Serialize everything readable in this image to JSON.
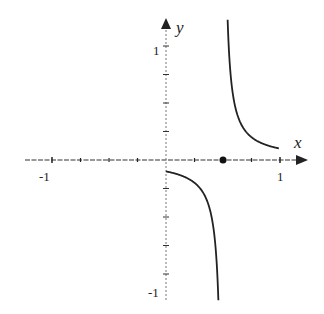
{
  "chart_data": {
    "type": "line",
    "title": "",
    "xlabel": "x",
    "ylabel": "y",
    "xlim": [
      -1.1,
      1.2
    ],
    "ylim": [
      -1.25,
      1.25
    ],
    "grid": false,
    "x_ticks": [
      -1,
      -0.75,
      -0.5,
      -0.25,
      0,
      0.25,
      0.5,
      0.75,
      1
    ],
    "y_ticks": [
      -1,
      -0.75,
      -0.5,
      -0.25,
      0.25,
      0.5,
      0.75,
      1
    ],
    "x_tick_labels": [
      {
        "value": -1,
        "label": "-1"
      },
      {
        "value": 1,
        "label": "1"
      }
    ],
    "y_tick_labels": [
      {
        "value": 1,
        "label": "1"
      },
      {
        "value": -1,
        "label": "-1"
      }
    ],
    "function": "y = 0.05 / (x - 0.5)",
    "vertical_asymptote": 0.5,
    "series": [
      {
        "name": "right branch",
        "x": [
          0.56,
          0.6,
          0.65,
          0.7,
          0.8,
          0.9,
          1.0
        ],
        "y": [
          0.83,
          0.5,
          0.33,
          0.25,
          0.17,
          0.125,
          0.1
        ]
      },
      {
        "name": "left branch",
        "x": [
          0.0,
          0.1,
          0.2,
          0.3,
          0.4,
          0.43
        ],
        "y": [
          -0.1,
          -0.125,
          -0.17,
          -0.25,
          -0.5,
          -0.71
        ]
      }
    ],
    "points": [
      {
        "x": 0.5,
        "y": 0,
        "label": "filled dot on x-axis"
      }
    ]
  },
  "labels": {
    "x_axis": "x",
    "y_axis": "y",
    "x_neg_one": "-1",
    "x_pos_one": "1",
    "y_pos_one": "1",
    "y_neg_one": "-1"
  }
}
